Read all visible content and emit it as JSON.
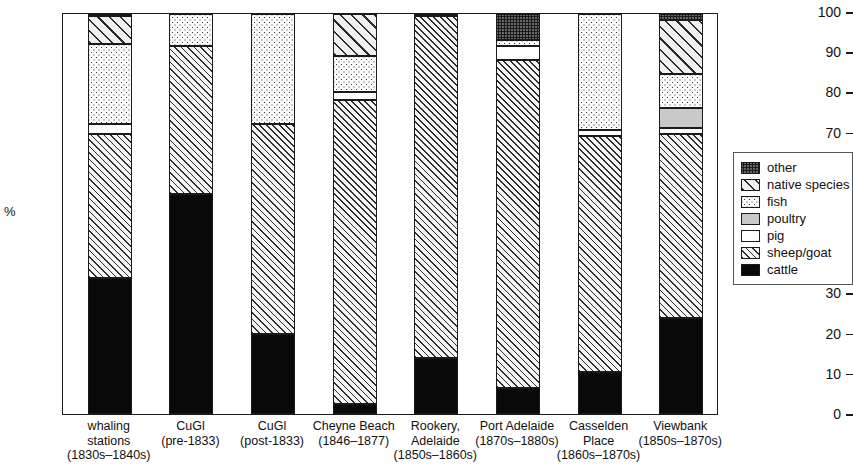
{
  "chart_data": {
    "type": "bar",
    "subtype": "stacked-bar-100-percent",
    "title": "",
    "xlabel": "",
    "ylabel": "%",
    "ylim": [
      0,
      100
    ],
    "yticks": [
      0,
      10,
      20,
      30,
      40,
      50,
      60,
      70,
      80,
      90,
      100
    ],
    "grid": false,
    "legend_position": "right",
    "categories": [
      "whaling stations (1830s–1840s)",
      "CuGl (pre-1833)",
      "CuGl (post-1833)",
      "Cheyne Beach (1846–1877)",
      "Rookery, Adelaide (1850s–1860s)",
      "Port Adelaide (1870s–1880s)",
      "Casselden Place (1860s–1870s)",
      "Viewbank (1850s–1870s)"
    ],
    "series": [
      {
        "name": "cattle",
        "values": [
          34.0,
          55.0,
          20.0,
          2.5,
          14.0,
          6.5,
          10.5,
          24.0
        ]
      },
      {
        "name": "sheep/goat",
        "values": [
          36.0,
          37.0,
          52.5,
          76.0,
          85.5,
          82.0,
          59.0,
          46.0
        ]
      },
      {
        "name": "pig",
        "values": [
          2.5,
          0.0,
          0.0,
          2.0,
          0.0,
          3.5,
          1.5,
          1.5
        ]
      },
      {
        "name": "poultry",
        "values": [
          0.0,
          0.0,
          0.0,
          0.0,
          0.0,
          0.0,
          0.0,
          5.0
        ]
      },
      {
        "name": "fish",
        "values": [
          20.0,
          8.0,
          27.5,
          9.0,
          0.0,
          1.5,
          29.0,
          8.5
        ]
      },
      {
        "name": "native species",
        "values": [
          7.0,
          0.0,
          0.0,
          10.5,
          0.0,
          0.0,
          0.0,
          13.5
        ]
      },
      {
        "name": "other",
        "values": [
          0.5,
          0.0,
          0.0,
          0.0,
          0.5,
          6.5,
          0.0,
          1.5
        ]
      }
    ]
  },
  "axis": {
    "y_label": "%",
    "y_ticks": [
      "100",
      "90",
      "80",
      "70",
      "60",
      "50",
      "40",
      "30",
      "20",
      "10",
      "0"
    ]
  },
  "x_labels": [
    {
      "line1": "whaling",
      "line2": "stations",
      "line3": "(1830s–1840s)"
    },
    {
      "line1": "CuGl",
      "line2": "(pre-1833)",
      "line3": ""
    },
    {
      "line1": "CuGl",
      "line2": "(post-1833)",
      "line3": ""
    },
    {
      "line1": "Cheyne Beach",
      "line2": "(1846–1877)",
      "line3": ""
    },
    {
      "line1": "Rookery,",
      "line2": "Adelaide",
      "line3": "(1850s–1860s)"
    },
    {
      "line1": "Port Adelaide",
      "line2": "(1870s–1880s)",
      "line3": ""
    },
    {
      "line1": "Casselden",
      "line2": "Place",
      "line3": "(1860s–1870s)"
    },
    {
      "line1": "Viewbank",
      "line2": "(1850s–1870s)",
      "line3": ""
    }
  ],
  "legend": {
    "items": [
      {
        "label": "other",
        "pattern": "dark-grey-speckle"
      },
      {
        "label": "native species",
        "pattern": "wide-diagonal-hatch"
      },
      {
        "label": "fish",
        "pattern": "fine-dots"
      },
      {
        "label": "poultry",
        "pattern": "solid-light-grey"
      },
      {
        "label": "pig",
        "pattern": "white"
      },
      {
        "label": "sheep/goat",
        "pattern": "dense-diagonal-hatch"
      },
      {
        "label": "cattle",
        "pattern": "solid-black"
      }
    ]
  },
  "colors": {
    "axis": "#1a1a1a",
    "cattle": "#090909",
    "other": "#5b5b5b",
    "poultry": "#c9c9c9",
    "background": "#ffffff"
  }
}
